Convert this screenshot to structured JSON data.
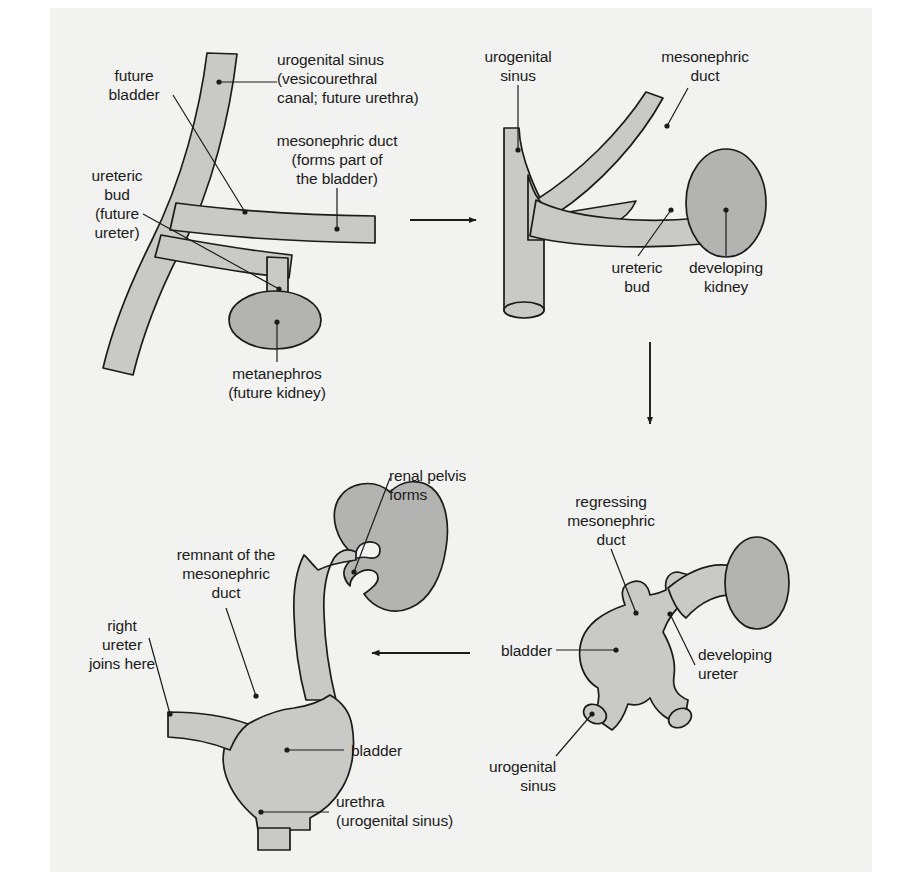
{
  "figure": {
    "background_color": "#f2f2f0",
    "page_color": "#ffffff",
    "tissue_fill_light": "#c9c9c7",
    "tissue_fill_dark": "#b3b3b1",
    "outline_color": "#1b1b1b",
    "text_color": "#1b1b1b"
  },
  "panels": [
    {
      "id": "panel-1",
      "name": "stage-1-ureteric-bud-arises",
      "labels": [
        {
          "key": "future_bladder",
          "text": "future\nbladder"
        },
        {
          "key": "urogenital_sinus",
          "text": "urogenital sinus\n(vesicourethral\ncanal; future urethra)"
        },
        {
          "key": "mesonephric_duct",
          "text": "mesonephric duct\n(forms part of\nthe bladder)"
        },
        {
          "key": "ureteric_bud",
          "text": "ureteric\nbud\n(future\nureter)"
        },
        {
          "key": "metanephros",
          "text": "metanephros\n(future kidney)"
        }
      ]
    },
    {
      "id": "panel-2",
      "name": "stage-2-developing-kidney",
      "labels": [
        {
          "key": "urogenital_sinus",
          "text": "urogenital\nsinus"
        },
        {
          "key": "mesonephric_duct",
          "text": "mesonephric\nduct"
        },
        {
          "key": "ureteric_bud",
          "text": "ureteric\nbud"
        },
        {
          "key": "developing_kidney",
          "text": "developing\nkidney"
        }
      ]
    },
    {
      "id": "panel-3",
      "name": "stage-3-regressing-mesonephric-duct",
      "labels": [
        {
          "key": "regressing_mesonephric_duct",
          "text": "regressing\nmesonephric\nduct"
        },
        {
          "key": "bladder",
          "text": "bladder"
        },
        {
          "key": "developing_ureter",
          "text": "developing\nureter"
        },
        {
          "key": "urogenital_sinus",
          "text": "urogenital\nsinus"
        }
      ]
    },
    {
      "id": "panel-4",
      "name": "stage-4-mature-kidney-and-bladder",
      "labels": [
        {
          "key": "renal_pelvis",
          "text": "renal pelvis\nforms"
        },
        {
          "key": "remnant_mesonephric_duct",
          "text": "remnant of the\nmesonephric\nduct"
        },
        {
          "key": "right_ureter",
          "text": "right\nureter\njoins here"
        },
        {
          "key": "bladder",
          "text": "bladder"
        },
        {
          "key": "urethra",
          "text": "urethra\n(urogenital sinus)"
        }
      ]
    }
  ],
  "arrows": [
    {
      "key": "arrow_1_to_2",
      "direction": "right"
    },
    {
      "key": "arrow_2_to_3",
      "direction": "down"
    },
    {
      "key": "arrow_3_to_4",
      "direction": "left"
    }
  ]
}
